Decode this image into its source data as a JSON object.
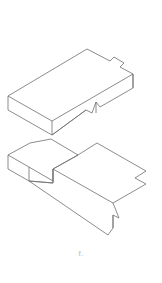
{
  "figure": {
    "kind": "technical-line-drawing",
    "caption": "f.",
    "background_color": "#ffffff",
    "line_color": "#6e6e72",
    "line_width": 0.8,
    "canvas": {
      "width": 162,
      "height": 283
    },
    "parts": [
      {
        "id": "upper-block",
        "label": "Upper block",
        "description": "Rectangular slab in isometric projection with a stepped notch cut at the far right corner and a small V notch cut into the lower front-right face.",
        "top_face_outline": [
          [
            87,
            49
          ],
          [
            110,
            61
          ],
          [
            114,
            57
          ],
          [
            124,
            63
          ],
          [
            120,
            67
          ],
          [
            133,
            74
          ],
          [
            52,
            121
          ],
          [
            8,
            96
          ]
        ],
        "front_left_face_outline": [
          [
            8,
            96
          ],
          [
            52,
            121
          ],
          [
            52,
            135
          ],
          [
            8,
            110
          ]
        ],
        "front_right_face_outline": [
          [
            52,
            121
          ],
          [
            133,
            74
          ],
          [
            133,
            88
          ],
          [
            100,
            107
          ],
          [
            96,
            102
          ],
          [
            92,
            113
          ],
          [
            86,
            110
          ],
          [
            52,
            135
          ]
        ],
        "notch_detail": {
          "name": "front-face-v-notch",
          "points": [
            [
              96,
              102
            ],
            [
              92,
              113
            ],
            [
              86,
              110
            ]
          ]
        },
        "step_detail": {
          "name": "top-right-step",
          "points": [
            [
              110,
              61
            ],
            [
              114,
              57
            ],
            [
              124,
              63
            ],
            [
              120,
              67
            ],
            [
              133,
              74
            ]
          ]
        }
      },
      {
        "id": "lower-block",
        "label": "Lower block",
        "description": "Mating piece in isometric projection with a left tab, a central rectangular socket, a stepped notch on the right edge and a stepped notch on the lower front edge.",
        "top_face_outline": [
          [
            51,
            139
          ],
          [
            78,
            155
          ],
          [
            97,
            143
          ],
          [
            146,
            171
          ],
          [
            135,
            178
          ],
          [
            146,
            184
          ],
          [
            113,
            203
          ],
          [
            53,
            169
          ],
          [
            53,
            181
          ],
          [
            29,
            167
          ],
          [
            8,
            155
          ],
          [
            30,
            143
          ]
        ],
        "front_left_face_outline": [
          [
            8,
            155
          ],
          [
            29,
            167
          ],
          [
            53,
            181
          ],
          [
            53,
            169
          ],
          [
            53,
            183
          ],
          [
            29,
            181
          ],
          [
            8,
            169
          ]
        ],
        "front_bottom_face_outline": [
          [
            29,
            181
          ],
          [
            108,
            235
          ],
          [
            113,
            228
          ],
          [
            113,
            215
          ],
          [
            119,
            218
          ],
          [
            113,
            203
          ]
        ],
        "left_socket": {
          "name": "central-socket",
          "points": [
            [
              51,
              139
            ],
            [
              78,
              155
            ],
            [
              53,
              169
            ],
            [
              53,
              181
            ]
          ]
        },
        "right_step": {
          "name": "right-edge-step",
          "points": [
            [
              146,
              171
            ],
            [
              135,
              178
            ],
            [
              146,
              184
            ],
            [
              113,
              203
            ]
          ]
        },
        "bottom_step": {
          "name": "bottom-edge-step",
          "points": [
            [
              113,
              203
            ],
            [
              119,
              218
            ],
            [
              113,
              215
            ],
            [
              113,
              228
            ],
            [
              108,
              235
            ]
          ]
        }
      }
    ]
  }
}
